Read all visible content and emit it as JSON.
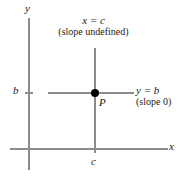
{
  "figure": {
    "axis_labels": {
      "x": "x",
      "y": "y"
    },
    "tick_labels": {
      "b": "b",
      "c": "c"
    },
    "point_label": "P",
    "vertical_line": {
      "equation": "x = c",
      "note": "(slope undefined)"
    },
    "horizontal_line": {
      "equation": "y = b",
      "note": "(slope 0)"
    },
    "colors": {
      "background": "#ffffff",
      "axis": "#8c8c8c",
      "line": "#8c8c8c",
      "point": "#000000",
      "text": "#1a1a1a"
    }
  }
}
